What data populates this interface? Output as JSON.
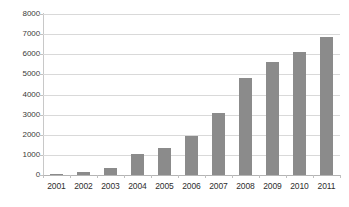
{
  "chart_data": {
    "type": "bar",
    "title": "",
    "subtitle": "",
    "xlabel": "",
    "ylabel": "",
    "categories": [
      "2001",
      "2002",
      "2003",
      "2004",
      "2005",
      "2006",
      "2007",
      "2008",
      "2009",
      "2010",
      "2011"
    ],
    "values": [
      50,
      130,
      370,
      1060,
      1360,
      1960,
      3080,
      4800,
      5600,
      6120,
      6880
    ],
    "series": [
      {
        "name": "",
        "values": [
          50,
          130,
          370,
          1060,
          1360,
          1960,
          3080,
          4800,
          5600,
          6120,
          6880
        ]
      }
    ],
    "ylim": [
      0,
      8000
    ],
    "yticks": [
      0,
      1000,
      2000,
      3000,
      4000,
      5000,
      6000,
      7000,
      8000
    ],
    "ytick_labels": [
      "0",
      "1000",
      "2000",
      "3000",
      "4000",
      "5000",
      "6000",
      "7000",
      "8000"
    ],
    "grid": true,
    "grid_axis": "y",
    "legend": false,
    "legend_position": "none",
    "bar_color": "#8b8b8b",
    "gridline_color": "#d9d9d9",
    "axis_color": "#b4b4b4",
    "background_color": "#ffffff",
    "text_color": "#2e2e2e"
  }
}
